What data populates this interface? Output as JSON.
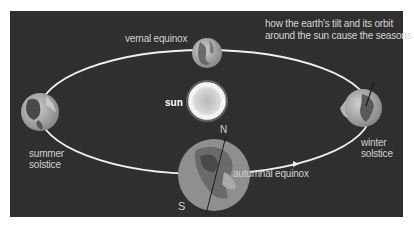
{
  "title": {
    "line1": "how the earth's tilt and its orbit",
    "line2": "around the sun cause the seasons"
  },
  "sun": {
    "label": "sun"
  },
  "positions": {
    "vernal": "vernal equinox",
    "summer_line1": "summer",
    "summer_line2": "solstice",
    "winter_line1": "winter",
    "winter_line2": "solstice",
    "autumnal": "autumnal equinox"
  },
  "poles": {
    "north": "N",
    "south": "S"
  },
  "colors": {
    "background": "#2f2f2f",
    "orbit": "#f2f2f2",
    "sun": "#e6e6e6",
    "earth_light": "#bdbdbd",
    "earth_dark": "#555555"
  }
}
